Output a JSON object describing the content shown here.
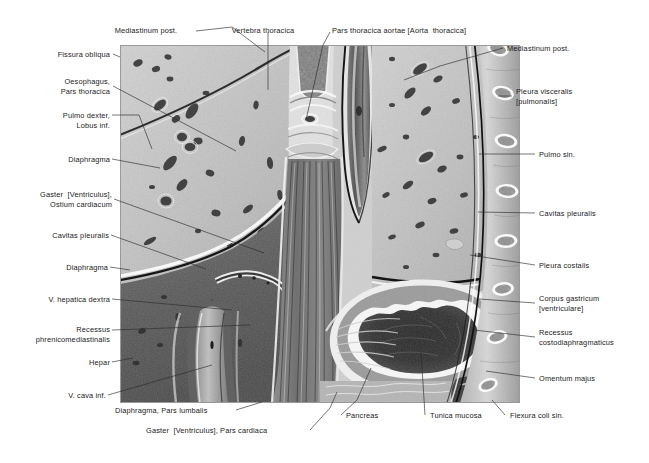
{
  "figure": {
    "kind": "anatomical-cross-section",
    "rendering": "grayscale halftone engraving",
    "colors": {
      "background": "#ffffff",
      "label_text": "#1a1a1a",
      "leader_line": "#2a2a2a",
      "plate_light": "#d6d6d6",
      "plate_mid": "#9e9e9e",
      "plate_dark": "#4a4a4a",
      "plate_darkest": "#1f1f1f"
    }
  },
  "labels": {
    "left": [
      {
        "id": "fissura-obliqua",
        "text": "Fissura obliqua"
      },
      {
        "id": "oesophagus-pars-thoracica",
        "text": "Oesophagus,\nPars thoracica"
      },
      {
        "id": "pulmo-dexter-lobus-inf",
        "text": "Pulmo dexter,\nLobus inf."
      },
      {
        "id": "diaphragma-upper",
        "text": "Diaphragma"
      },
      {
        "id": "gaster-ostium-cardiacum",
        "text": "Gaster  [Ventriculus],\nOstium cardiacum"
      },
      {
        "id": "cavitas-pleuralis-left",
        "text": "Cavitas pleuralis"
      },
      {
        "id": "diaphragma-lower",
        "text": "Diaphragma"
      },
      {
        "id": "v-hepatica-dextra",
        "text": "V. hepatica dextra"
      },
      {
        "id": "recessus-phrenicomediastinalis",
        "text": "Recessus\nphrenicomediastinalis"
      },
      {
        "id": "hepar",
        "text": "Hepar"
      },
      {
        "id": "v-cava-inf",
        "text": "V. cava inf."
      }
    ],
    "top": [
      {
        "id": "mediastinum-post-top",
        "text": "Mediastinum post."
      },
      {
        "id": "vertebra-thoracica",
        "text": "Vertebra thoracica"
      },
      {
        "id": "pars-thoracica-aortae",
        "text": "Pars thoracica aortae [Aorta  thoracica]"
      }
    ],
    "right": [
      {
        "id": "mediastinum-post-right",
        "text": "Mediastinum post."
      },
      {
        "id": "pleura-visceralis",
        "text": "Pleura visceralis\n[pulmonalis]"
      },
      {
        "id": "pulmo-sin",
        "text": "Pulmo sin."
      },
      {
        "id": "cavitas-pleuralis-right",
        "text": "Cavitas pleuralis"
      },
      {
        "id": "pleura-costalis",
        "text": "Pleura costalis"
      },
      {
        "id": "corpus-gastricum",
        "text": "Corpus gastricum\n[ventriculare]"
      },
      {
        "id": "recessus-costodiaphragmaticus",
        "text": "Recessus\ncostodiaphragmaticus"
      },
      {
        "id": "omentum-majus",
        "text": "Omentum majus"
      }
    ],
    "bottom": [
      {
        "id": "diaphragma-pars-lumbalis",
        "text": "Diaphragma, Pars lumbalis"
      },
      {
        "id": "gaster-pars-cardiaca",
        "text": "Gaster  [Ventriculus], Pars cardiaca"
      },
      {
        "id": "pancreas",
        "text": "Pancreas"
      },
      {
        "id": "tunica-mucosa",
        "text": "Tunica mucosa"
      },
      {
        "id": "flexura-coli-sin",
        "text": "Flexura coli sin."
      }
    ]
  }
}
